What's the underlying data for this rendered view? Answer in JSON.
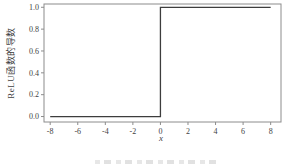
{
  "figure": {
    "xlabel": "x",
    "ylabel": "ReLU函数的导数"
  },
  "chart_data": {
    "type": "line",
    "title": "",
    "xlabel": "x",
    "ylabel": "ReLU函数的导数",
    "xlim": [
      -8.45,
      8.75
    ],
    "ylim": [
      -0.05,
      1.03
    ],
    "x_ticks": [
      -8,
      -6,
      -4,
      -2,
      0,
      2,
      4,
      6,
      8
    ],
    "x_tick_labels": [
      "-8",
      "-6",
      "-4",
      "-2",
      "0",
      "2",
      "4",
      "6",
      "8"
    ],
    "y_ticks": [
      0.0,
      0.2,
      0.4,
      0.6,
      0.8,
      1.0
    ],
    "y_tick_labels": [
      "0.0",
      "0.2",
      "0.4",
      "0.6",
      "0.8",
      "1.0"
    ],
    "grid": false,
    "legend_position": "none",
    "series": [
      {
        "name": "ReLU函数的导数 (阶跃函数)",
        "x": [
          -8,
          0,
          0,
          8
        ],
        "y": [
          0,
          0,
          1,
          1
        ]
      }
    ],
    "colors": {
      "line": "#3d3d3d",
      "frame": "#8c8c8c",
      "text": "#3f3f3f",
      "background": "#ffffff"
    }
  }
}
